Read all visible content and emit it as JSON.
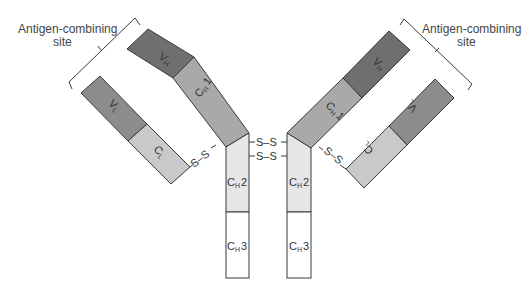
{
  "diagram": {
    "type": "antibody-structure",
    "colors": {
      "variable_heavy": "#6f6f6f",
      "variable_light": "#8c8c8c",
      "constant_heavy1": "#a9a9a9",
      "constant_light": "#c9c9c9",
      "constant_heavy2": "#e6e6e6",
      "constant_heavy3": "#ffffff",
      "outline": "#3a3a3a"
    },
    "labels": {
      "site_left_line1": "Antigen-combining",
      "site_left_line2": "site",
      "site_right_line1": "Antigen-combining",
      "site_right_line2": "site"
    },
    "domains": {
      "left_vh": {
        "main": "V",
        "sub": "H"
      },
      "left_ch1": {
        "main": "C",
        "sub": "H",
        "suffix": "1"
      },
      "left_vl": {
        "main": "V",
        "sub": "L"
      },
      "left_cl": {
        "main": "C",
        "sub": "L"
      },
      "right_vh": {
        "main": "V",
        "sub": "H"
      },
      "right_ch1": {
        "main": "C",
        "sub": "H",
        "suffix": "1"
      },
      "right_vl": {
        "main": "V",
        "sub": "L"
      },
      "right_cl": {
        "main": "C",
        "sub": "L"
      },
      "left_ch2": {
        "main": "C",
        "sub": "H",
        "suffix": "2"
      },
      "left_ch3": {
        "main": "C",
        "sub": "H",
        "suffix": "3"
      },
      "right_ch2": {
        "main": "C",
        "sub": "H",
        "suffix": "2"
      },
      "right_ch3": {
        "main": "C",
        "sub": "H",
        "suffix": "3"
      }
    },
    "disulfide": {
      "hinge_top": "S–S",
      "hinge_bottom": "S–S",
      "left_interchain": "S–S",
      "right_interchain": "S–S"
    }
  }
}
